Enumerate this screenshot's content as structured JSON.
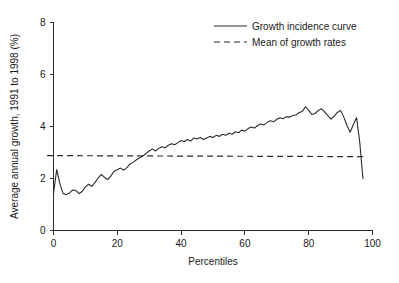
{
  "chart_data": {
    "type": "line",
    "title": "",
    "xlabel": "Percentiles",
    "ylabel": "Average annual growth, 1991 to 1998 (%)",
    "xlim": [
      -2,
      100
    ],
    "ylim": [
      0,
      8
    ],
    "xticks": [
      0,
      20,
      40,
      60,
      80,
      100
    ],
    "xticklabels": [
      "0",
      "20",
      "40",
      "60",
      "80",
      "100"
    ],
    "yticks": [
      0,
      2,
      4,
      6,
      8
    ],
    "yticklabels": [
      "0",
      "2",
      "4",
      "6",
      "8"
    ],
    "grid": false,
    "legend_position": "top-right",
    "legend": [
      {
        "label": "Growth incidence curve",
        "style": "solid"
      },
      {
        "label": "Mean of growth rates",
        "style": "dashed"
      }
    ],
    "series": [
      {
        "name": "Growth incidence curve",
        "style": "solid",
        "x": [
          0,
          1,
          2,
          3,
          4,
          5,
          6,
          7,
          8,
          9,
          10,
          11,
          12,
          13,
          14,
          15,
          16,
          17,
          18,
          19,
          20,
          21,
          22,
          23,
          24,
          25,
          26,
          27,
          28,
          29,
          30,
          31,
          32,
          33,
          34,
          35,
          36,
          37,
          38,
          39,
          40,
          41,
          42,
          43,
          44,
          45,
          46,
          47,
          48,
          49,
          50,
          51,
          52,
          53,
          54,
          55,
          56,
          57,
          58,
          59,
          60,
          61,
          62,
          63,
          64,
          65,
          66,
          67,
          68,
          69,
          70,
          71,
          72,
          73,
          74,
          75,
          76,
          77,
          78,
          79,
          80,
          81,
          82,
          83,
          84,
          85,
          86,
          87,
          88,
          89,
          90,
          91,
          92,
          93,
          94,
          95,
          96,
          97
        ],
        "y": [
          1.42,
          2.34,
          1.8,
          1.42,
          1.38,
          1.44,
          1.56,
          1.54,
          1.42,
          1.5,
          1.68,
          1.78,
          1.7,
          1.84,
          2.02,
          2.16,
          2.04,
          1.96,
          2.1,
          2.28,
          2.34,
          2.4,
          2.32,
          2.42,
          2.56,
          2.62,
          2.72,
          2.8,
          2.86,
          2.96,
          3.06,
          3.14,
          3.06,
          3.16,
          3.22,
          3.18,
          3.28,
          3.34,
          3.3,
          3.38,
          3.46,
          3.42,
          3.5,
          3.44,
          3.56,
          3.52,
          3.58,
          3.5,
          3.56,
          3.62,
          3.58,
          3.66,
          3.62,
          3.7,
          3.66,
          3.74,
          3.7,
          3.8,
          3.76,
          3.86,
          3.82,
          3.92,
          3.98,
          3.94,
          4.04,
          4.1,
          4.06,
          4.16,
          4.22,
          4.18,
          4.28,
          4.34,
          4.3,
          4.38,
          4.36,
          4.42,
          4.44,
          4.54,
          4.58,
          4.76,
          4.62,
          4.46,
          4.5,
          4.62,
          4.68,
          4.56,
          4.42,
          4.28,
          4.4,
          4.54,
          4.62,
          4.36,
          4.04,
          3.78,
          4.08,
          4.34,
          3.4,
          2.0
        ]
      },
      {
        "name": "Mean of growth rates",
        "style": "dashed",
        "x": [
          -2,
          98
        ],
        "y": [
          2.88,
          2.84
        ]
      }
    ]
  }
}
